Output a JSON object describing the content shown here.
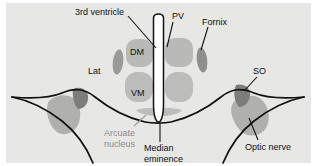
{
  "figure": {
    "background_color": "#e7e7e5",
    "outline_color": "#111111",
    "ventricle_fill": "#ffffff",
    "nucleus_fill_light": "#b9b9b7",
    "nucleus_fill_dark": "#838381",
    "label_color": "#101010",
    "label_color_muted": "#8d8d8d"
  },
  "labels": {
    "third_ventricle": "3rd ventricle",
    "pv": "PV",
    "fornix": "Fornix",
    "dm": "DM",
    "vm": "VM",
    "lat": "Lat",
    "so": "SO",
    "arcuate_nucleus_line1": "Arcuate",
    "arcuate_nucleus_line2": "nucleus",
    "median_eminence_line1": "Median",
    "median_eminence_line2": "eminence",
    "optic_nerve": "Optic nerve"
  },
  "structures": [
    {
      "name": "third-ventricle",
      "label": "3rd ventricle",
      "fill": "#ffffff"
    },
    {
      "name": "paraventricular-nucleus",
      "label": "PV",
      "fill": "#b9b9b7"
    },
    {
      "name": "fornix",
      "label": "Fornix",
      "fill": "#838381"
    },
    {
      "name": "dorsomedial-nucleus",
      "label": "DM",
      "fill": "#b9b9b7"
    },
    {
      "name": "ventromedial-nucleus",
      "label": "VM",
      "fill": "#b9b9b7"
    },
    {
      "name": "lateral-hypothalamus",
      "label": "Lat",
      "fill": "#e7e7e5"
    },
    {
      "name": "supraoptic-nucleus",
      "label": "SO",
      "fill": "#838381"
    },
    {
      "name": "arcuate-nucleus",
      "label": "Arcuate nucleus",
      "fill": "#b9b9b7"
    },
    {
      "name": "median-eminence",
      "label": "Median eminence",
      "fill": "#ffffff"
    },
    {
      "name": "optic-nerve",
      "label": "Optic nerve",
      "fill": "#b9b9b7"
    }
  ]
}
